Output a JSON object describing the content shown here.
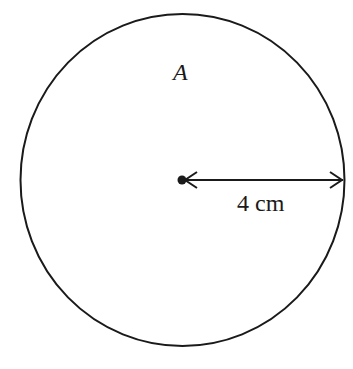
{
  "diagram": {
    "type": "circle",
    "shape_label": "A",
    "radius_label": "4 cm",
    "radius_value": 4,
    "radius_unit": "cm",
    "stroke_color": "#1a1a1a",
    "background_color": "#ffffff"
  }
}
